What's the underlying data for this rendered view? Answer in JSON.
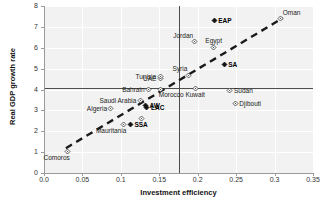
{
  "chart_data": {
    "type": "scatter",
    "title": "",
    "xlabel": "Investment efficiency",
    "ylabel": "Real GDP growth rate",
    "xlim": [
      0.0,
      0.35
    ],
    "ylim": [
      0,
      8
    ],
    "xticks": [
      "0.0",
      "0.05",
      "0.1",
      "0.15",
      "0.2",
      "0.25",
      "0.3",
      "0.35"
    ],
    "xtick_values": [
      0.0,
      0.05,
      0.1,
      0.15,
      0.2,
      0.25,
      0.3,
      0.35
    ],
    "yticks": [
      "0",
      "1",
      "2",
      "3",
      "4",
      "5",
      "6",
      "7",
      "8"
    ],
    "ytick_values": [
      0,
      1,
      2,
      3,
      4,
      5,
      6,
      7,
      8
    ],
    "grid": true,
    "legend": "none",
    "reference_lines": [
      {
        "orientation": "horizontal",
        "value": 4.05,
        "label": ""
      },
      {
        "orientation": "vertical",
        "value": 0.1755,
        "label": ""
      }
    ],
    "trendline": {
      "style": "dashed",
      "x": [
        0.0285,
        0.3105
      ],
      "y": [
        1.19,
        7.42
      ]
    },
    "points": [
      {
        "label": "Comoros",
        "x": 0.0305,
        "y": 1.05,
        "marker": "open-diamond",
        "label_pos": "below-left"
      },
      {
        "label": "Mauritania",
        "x": 0.104,
        "y": 2.34,
        "marker": "open-diamond",
        "label_pos": "below-left"
      },
      {
        "label": "SSA",
        "x": 0.1125,
        "y": 2.3,
        "marker": "filled-diamond",
        "label_pos": "right"
      },
      {
        "label": "Algeria",
        "x": 0.087,
        "y": 3.09,
        "marker": "open-diamond",
        "label_pos": "left"
      },
      {
        "label": "Saudi Arabia",
        "x": 0.1255,
        "y": 3.45,
        "marker": "open-diamond",
        "label_pos": "left"
      },
      {
        "label": "Bahrain",
        "x": 0.1355,
        "y": 4.0,
        "marker": "open-diamond",
        "label_pos": "left"
      },
      {
        "label": "AW",
        "x": 0.132,
        "y": 3.25,
        "marker": "filled-diamond",
        "label_pos": "right"
      },
      {
        "label": "LAC",
        "x": 0.134,
        "y": 3.14,
        "marker": "filled-diamond",
        "label_pos": "right"
      },
      {
        "label": "UAE",
        "x": 0.151,
        "y": 4.52,
        "marker": "open-diamond",
        "label_pos": "left"
      },
      {
        "label": "Tunisia",
        "x": 0.1515,
        "y": 4.62,
        "marker": "open-diamond",
        "label_pos": "left"
      },
      {
        "label": "Morocco",
        "x": 0.152,
        "y": 4.02,
        "marker": "open-diamond",
        "label_pos": "below-right"
      },
      {
        "label": "",
        "x": 0.1265,
        "y": 2.62,
        "marker": "open-diamond",
        "label_pos": "none"
      },
      {
        "label": "Syria",
        "x": 0.188,
        "y": 4.68,
        "marker": "open-diamond",
        "label_pos": "above-left"
      },
      {
        "label": "Kuwait",
        "x": 0.197,
        "y": 4.05,
        "marker": "open-diamond",
        "label_pos": "below"
      },
      {
        "label": "Jordan",
        "x": 0.1955,
        "y": 6.28,
        "marker": "open-diamond",
        "label_pos": "above-left"
      },
      {
        "label": "Egypt",
        "x": 0.221,
        "y": 6.03,
        "marker": "open-diamond",
        "label_pos": "above"
      },
      {
        "label": "EAP",
        "x": 0.2215,
        "y": 7.3,
        "marker": "filled-diamond",
        "label_pos": "right"
      },
      {
        "label": "SA",
        "x": 0.2345,
        "y": 5.22,
        "marker": "filled-diamond",
        "label_pos": "right"
      },
      {
        "label": "Sudan",
        "x": 0.242,
        "y": 3.97,
        "marker": "open-diamond",
        "label_pos": "right"
      },
      {
        "label": "Djibouti",
        "x": 0.249,
        "y": 3.35,
        "marker": "open-diamond",
        "label_pos": "right"
      },
      {
        "label": "Oman",
        "x": 0.308,
        "y": 7.4,
        "marker": "open-diamond",
        "label_pos": "above-right"
      }
    ]
  }
}
